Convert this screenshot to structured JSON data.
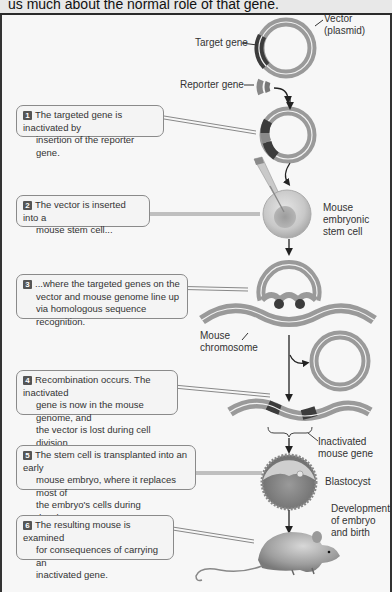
{
  "header": {
    "caption_fragment": "us much about the normal role of that gene."
  },
  "labels": {
    "target_gene": "Target gene",
    "vector_line1": "Vector",
    "vector_line2": "(plasmid)",
    "reporter_gene": "Reporter gene",
    "stem_cell_line1": "Mouse",
    "stem_cell_line2": "embryonic",
    "stem_cell_line3": "stem cell",
    "chromosome_line1": "Mouse",
    "chromosome_line2": "chromosome",
    "inactivated_line1": "Inactivated",
    "inactivated_line2": "mouse gene",
    "blastocyst": "Blastocyst",
    "development_line1": "Development",
    "development_line2": "of embryo",
    "development_line3": "and birth"
  },
  "steps": [
    {
      "number": "1",
      "lines": [
        "The targeted gene is inactivated by",
        "insertion of the reporter gene."
      ]
    },
    {
      "number": "2",
      "lines": [
        "The vector is inserted into a",
        "mouse stem cell..."
      ]
    },
    {
      "number": "3",
      "lines": [
        "...where the targeted genes on the",
        "vector and mouse genome line up",
        "via homologous sequence recognition."
      ]
    },
    {
      "number": "4",
      "lines": [
        "Recombination occurs. The inactivated",
        "gene is now in the mouse genome, and",
        "the vector is lost during cell division."
      ]
    },
    {
      "number": "5",
      "lines": [
        "The stem cell is transplanted into an early",
        "mouse embryo, where it replaces most of",
        "the embryo's cells during development."
      ]
    },
    {
      "number": "6",
      "lines": [
        "The resulting mouse is examined",
        "for consequences of carrying an",
        "inactivated gene."
      ]
    }
  ],
  "colors": {
    "ring": "#9a9a9a",
    "ring_inner": "#f2f2f2",
    "gene_dark": "#3c3c3c",
    "reporter": "#7a7a7a",
    "arrow": "#222222",
    "frame": "#333333"
  }
}
